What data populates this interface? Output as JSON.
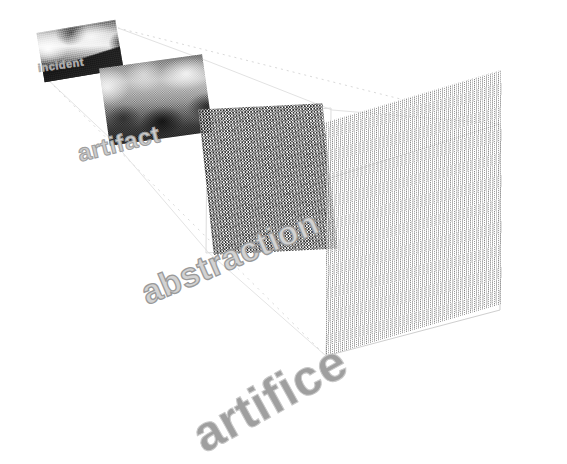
{
  "figure": {
    "background_color": "#ffffff",
    "width": 567,
    "height": 464,
    "perspective_line_color": "#d9d9d9",
    "vanishing_direction": "upper-left"
  },
  "stages": [
    {
      "id": "incident",
      "label": "incident",
      "order": 1,
      "texture": "photographic-grayscale-street-scene",
      "label_font_size_px": 11,
      "label_color": "#b9b9b9",
      "panel_left": 40,
      "panel_top": 26,
      "panel_width": 80,
      "panel_height": 50,
      "panel_rotation_deg": -9.5
    },
    {
      "id": "artifact",
      "label": "artifact",
      "order": 2,
      "texture": "blurred-grainy-halftone",
      "label_font_size_px": 24,
      "label_color": "#cccccc",
      "panel_left": 104,
      "panel_top": 61,
      "panel_width": 104,
      "panel_height": 78,
      "panel_rotation_deg": -8
    },
    {
      "id": "abstraction",
      "label": "abstraction",
      "order": 3,
      "texture": "dense-dither-speckle",
      "label_font_size_px": 34,
      "label_color": "#d2d2d2",
      "panel_left": 206,
      "panel_top": 106,
      "panel_width": 124,
      "panel_height": 146,
      "panel_rotation_deg": -6
    },
    {
      "id": "artifice",
      "label": "artifice",
      "order": 4,
      "texture": "fine-sparse-noise",
      "label_font_size_px": 50,
      "label_color": "#9f9f9f",
      "panel_left": 326,
      "panel_top": 122,
      "panel_width": 176,
      "panel_height": 234,
      "panel_rotation_deg": 0
    }
  ]
}
